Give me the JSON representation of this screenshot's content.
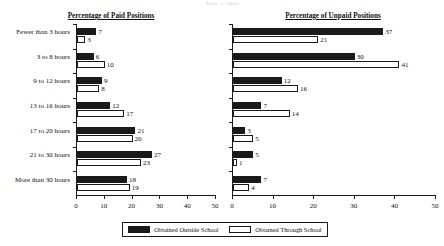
{
  "top_note": "Table 1: 2001",
  "legend": {
    "items": [
      {
        "key": "outside",
        "label": "Obtained Outside School",
        "color": "#1a1a1a",
        "style": "filled"
      },
      {
        "key": "through",
        "label": "Obtained Through School",
        "color": "#ffffff",
        "style": "outlined"
      }
    ]
  },
  "chart_data": [
    {
      "type": "bar",
      "orientation": "horizontal",
      "title": "Percentage of Paid Positions",
      "xlabel": "",
      "ylabel": "",
      "xlim": [
        0,
        50
      ],
      "xticks": [
        0,
        10,
        20,
        30,
        40,
        50
      ],
      "grid": false,
      "legend_position": "bottom-center",
      "categories": [
        "Fewer than 3 hours",
        "3 to 8 hours",
        "9 to 12 hours",
        "13 to 16 hours",
        "17 to 20 hours",
        "21 to 30 hours",
        "More than 30 hours"
      ],
      "series": [
        {
          "name": "Obtained Outside School",
          "values": [
            7,
            6,
            9,
            12,
            21,
            27,
            18
          ]
        },
        {
          "name": "Obtained Through School",
          "values": [
            3,
            10,
            8,
            17,
            20,
            23,
            19
          ]
        }
      ]
    },
    {
      "type": "bar",
      "orientation": "horizontal",
      "title": "Percentage of Unpaid Positions",
      "xlabel": "",
      "ylabel": "",
      "xlim": [
        0,
        50
      ],
      "xticks": [
        0,
        10,
        20,
        30,
        40,
        50
      ],
      "grid": false,
      "legend_position": "bottom-center",
      "categories": [
        "Fewer than 3 hours",
        "3 to 8 hours",
        "9 to 12 hours",
        "13 to 16 hours",
        "17 to 20 hours",
        "21 to 30 hours",
        "More than 30 hours"
      ],
      "series": [
        {
          "name": "Obtained Outside School",
          "values": [
            37,
            30,
            12,
            7,
            3,
            5,
            7
          ]
        },
        {
          "name": "Obtained Through School",
          "values": [
            21,
            41,
            16,
            14,
            5,
            1,
            4
          ]
        }
      ]
    }
  ]
}
